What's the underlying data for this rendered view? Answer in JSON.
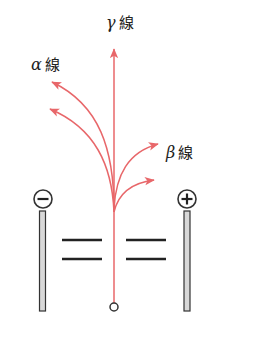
{
  "colors": {
    "ray": "#e8676a",
    "outline": "#333333",
    "electrode_fill": "#d8d8d8",
    "text": "#222222"
  },
  "labels": {
    "gamma": {
      "greek": "γ",
      "text": "線"
    },
    "alpha": {
      "greek": "α",
      "text": "線"
    },
    "beta": {
      "greek": "β",
      "text": "線"
    }
  },
  "electrodes": {
    "negative": {
      "symbol": "minus",
      "charge": "−"
    },
    "positive": {
      "symbol": "plus",
      "charge": "+"
    }
  },
  "rays": [
    {
      "name": "gamma",
      "deflection": "none"
    },
    {
      "name": "alpha",
      "deflection": "toward-negative",
      "count": 2
    },
    {
      "name": "beta",
      "deflection": "toward-positive",
      "count": 2
    }
  ],
  "source": {
    "shape": "circle"
  },
  "slits": {
    "count": 2
  }
}
